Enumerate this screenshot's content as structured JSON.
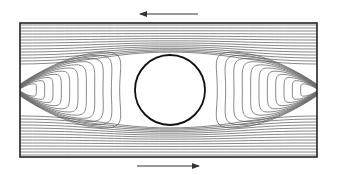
{
  "diagram": {
    "type": "streamlines",
    "canvas": {
      "width": 337,
      "height": 175,
      "background": "#ffffff"
    },
    "box": {
      "x": 20,
      "y": 23,
      "width": 297,
      "height": 134,
      "stroke": "#222222",
      "stroke_width": 1.6
    },
    "cylinder": {
      "cx": 170,
      "cy": 90,
      "r": 35,
      "stroke": "#111111",
      "stroke_width": 1.8,
      "fill": "#ffffff"
    },
    "top_arrow": {
      "direction": "left",
      "x1": 198,
      "x2": 140,
      "y": 14,
      "color": "#333333"
    },
    "bottom_arrow": {
      "direction": "right",
      "x1": 137,
      "x2": 199,
      "y": 166,
      "color": "#333333"
    },
    "streamline_color": "#555555",
    "wall_lines_per_side": 14,
    "closed_loops_per_side": 11
  }
}
